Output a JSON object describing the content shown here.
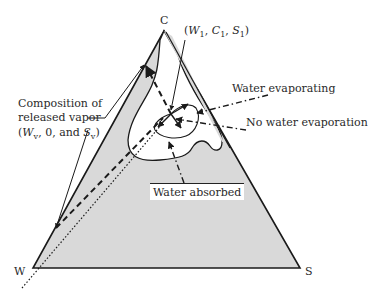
{
  "diagram": {
    "type": "ternary-phase-diagram",
    "vertices": {
      "top": "C",
      "bottom_left": "W",
      "bottom_right": "S"
    },
    "labels": {
      "point": "(W1, C1, S1)",
      "point_parts": {
        "open": "(",
        "w": "W",
        "w_sub": "1",
        "sep1": ", ",
        "c": "C",
        "c_sub": "1",
        "sep2": ", ",
        "s": "S",
        "s_sub": "1",
        "close": ")"
      },
      "vapor_line1": "Composition of",
      "vapor_line2": "released vapor",
      "vapor_line3": {
        "open": "(",
        "w": "W",
        "w_sub": "v",
        "mid": ", 0, and ",
        "s": "S",
        "s_sub": "v",
        "close": ")"
      },
      "water_evaporating": "Water evaporating",
      "no_water_evaporation": "No water evaporation",
      "water_absorbed": "Water absorbed"
    },
    "colors": {
      "fill": "#d9d9d9",
      "line": "#1a1a1a",
      "background": "#ffffff"
    }
  }
}
